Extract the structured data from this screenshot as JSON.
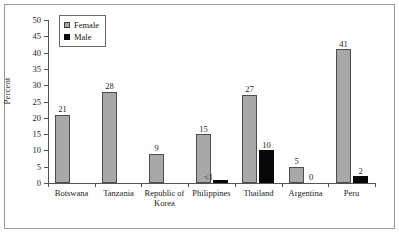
{
  "chart_data": {
    "type": "bar",
    "title": "",
    "xlabel": "",
    "ylabel": "Percent",
    "ylim": [
      0,
      50
    ],
    "yticks": [
      0,
      5,
      10,
      15,
      20,
      25,
      30,
      35,
      40,
      45,
      50
    ],
    "grid": false,
    "legend_position": "top-left",
    "categories": [
      "Botswana",
      "Tanzania",
      "Republic of\nKorea",
      "Philippines",
      "Thailand",
      "Argentina",
      "Peru"
    ],
    "series": [
      {
        "name": "Female",
        "color": "#a8a8a8",
        "values": [
          21,
          28,
          9,
          15,
          27,
          5,
          41
        ],
        "labels": [
          "21",
          "28",
          "9",
          "15",
          "27",
          "5",
          "41"
        ]
      },
      {
        "name": "Male",
        "color": "#080808",
        "values": [
          0,
          0,
          0,
          0.4,
          10,
          0,
          2
        ],
        "labels": [
          "",
          "",
          "",
          "<1",
          "10",
          "0",
          "2"
        ]
      }
    ]
  },
  "axis": {
    "y_label": "Percent",
    "y_tick_labels": [
      "50",
      "45",
      "40",
      "35",
      "30",
      "25",
      "20",
      "15",
      "10",
      "5",
      "0"
    ]
  },
  "legend": {
    "items": [
      {
        "label": "Female",
        "swatch": "gray-swatch-icon"
      },
      {
        "label": "Male",
        "swatch": "black-swatch-icon"
      }
    ]
  },
  "x_axis_labels": [
    "Botswana",
    "Tanzania",
    "Republic of\nKorea",
    "Philippines",
    "Thailand",
    "Argentina",
    "Peru"
  ],
  "value_labels": {
    "botswana_female": "21",
    "tanzania_female": "28",
    "korea_female": "9",
    "philippines_female": "15",
    "philippines_male": "<1",
    "thailand_female": "27",
    "thailand_male": "10",
    "argentina_female": "5",
    "argentina_male": "0",
    "peru_female": "41",
    "peru_male": "2"
  }
}
